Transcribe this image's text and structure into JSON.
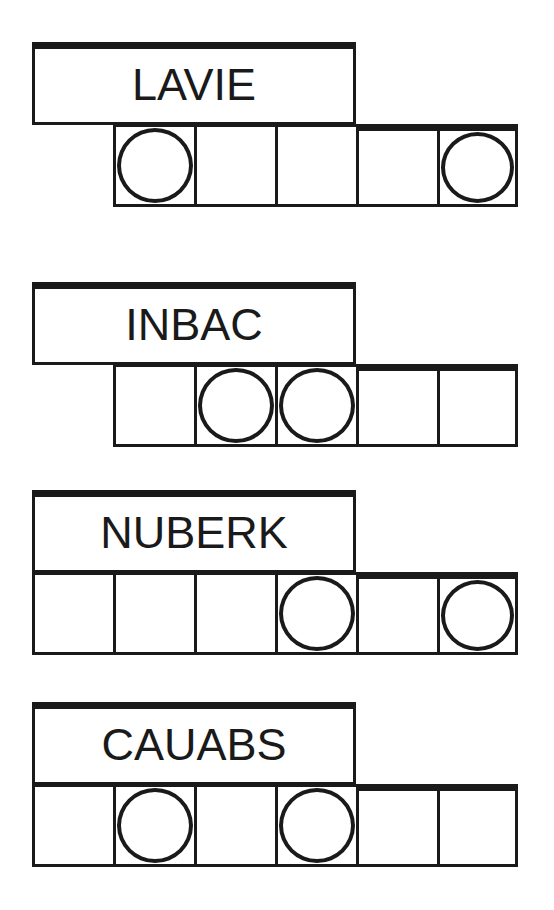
{
  "worksheet": {
    "title_text_color": "#1a1a1a",
    "background_color": "#ffffff",
    "line_color": "#1a1a1a",
    "groups": [
      {
        "word": "LAVIE",
        "word_box": {
          "x": 32,
          "y": 42,
          "width": 324,
          "height": 83
        },
        "grid": {
          "x": 113,
          "y": 124,
          "cell_width": 81,
          "cell_height": 83,
          "cell_count": 5
        },
        "circle_cells": [
          1,
          5
        ],
        "thick_top_from_cell": 4
      },
      {
        "word": "INBAC",
        "word_box": {
          "x": 32,
          "y": 282,
          "width": 324,
          "height": 83
        },
        "grid": {
          "x": 113,
          "y": 364,
          "cell_width": 81,
          "cell_height": 83,
          "cell_count": 5
        },
        "circle_cells": [
          2,
          3
        ],
        "thick_top_from_cell": 4
      },
      {
        "word": "NUBERK",
        "word_box": {
          "x": 32,
          "y": 490,
          "width": 324,
          "height": 83
        },
        "grid": {
          "x": 32,
          "y": 572,
          "cell_width": 81,
          "cell_height": 83,
          "cell_count": 6
        },
        "circle_cells": [
          4,
          6
        ],
        "thick_top_from_cell": 5
      },
      {
        "word": "CAUABS",
        "word_box": {
          "x": 32,
          "y": 702,
          "width": 324,
          "height": 83
        },
        "grid": {
          "x": 32,
          "y": 784,
          "cell_width": 81,
          "cell_height": 83,
          "cell_count": 6
        },
        "circle_cells": [
          2,
          4
        ],
        "thick_top_from_cell": 5
      }
    ]
  }
}
